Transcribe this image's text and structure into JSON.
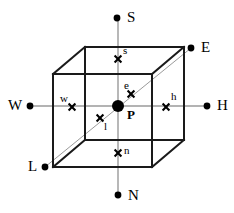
{
  "figure": {
    "type": "control-volume-cube-diagram",
    "width": 234,
    "height": 213,
    "colors": {
      "background": "#ffffff",
      "cube_stroke": "#1a1a1a",
      "axis_stroke": "#9a9a9a",
      "diagonal_stroke": "#9a9a9a",
      "marker": "#000000",
      "label": "#000000"
    },
    "stroke_widths": {
      "cube": 2.0,
      "axis": 1.3,
      "diagonal": 1.0
    }
  },
  "cube": {
    "front_face": [
      [
        53,
        74
      ],
      [
        152,
        74
      ],
      [
        152,
        167
      ],
      [
        53,
        167
      ]
    ],
    "back_face": [
      [
        85,
        47
      ],
      [
        184,
        47
      ],
      [
        184,
        140
      ],
      [
        85,
        140
      ]
    ],
    "connectors": [
      [
        [
          53,
          74
        ],
        [
          85,
          47
        ]
      ],
      [
        [
          152,
          74
        ],
        [
          184,
          47
        ]
      ],
      [
        [
          152,
          167
        ],
        [
          184,
          140
        ]
      ],
      [
        [
          53,
          167
        ],
        [
          85,
          140
        ]
      ]
    ]
  },
  "axes": [
    {
      "name": "vertical-axis-south-north",
      "x1": 118,
      "y1": 18,
      "x2": 118,
      "y2": 195
    },
    {
      "name": "horizontal-axis-west-high",
      "x1": 30,
      "y1": 106,
      "x2": 207,
      "y2": 106
    },
    {
      "name": "diagonal-axis-low-east",
      "x1": 45,
      "y1": 167,
      "x2": 191,
      "y2": 48
    }
  ],
  "center_node": {
    "label": "P",
    "x": 118,
    "y": 106,
    "radius": 6,
    "label_x": 128,
    "label_y": 108
  },
  "direction_nodes": [
    {
      "name": "node-south",
      "label": "S",
      "dot_x": 117,
      "dot_y": 18,
      "label_x": 127,
      "label_y": 11
    },
    {
      "name": "node-east",
      "label": "E",
      "dot_x": 191,
      "dot_y": 48,
      "label_x": 201,
      "label_y": 41
    },
    {
      "name": "node-high",
      "label": "H",
      "dot_x": 207,
      "dot_y": 106,
      "label_x": 217,
      "label_y": 99
    },
    {
      "name": "node-north",
      "label": "N",
      "dot_x": 118,
      "dot_y": 195,
      "label_x": 128,
      "label_y": 189
    },
    {
      "name": "node-low",
      "label": "L",
      "dot_x": 45,
      "dot_y": 167,
      "label_x": 28,
      "label_y": 160
    },
    {
      "name": "node-west",
      "label": "W",
      "dot_x": 30,
      "dot_y": 106,
      "label_x": 10,
      "label_y": 99
    }
  ],
  "face_markers": [
    {
      "name": "face-marker-s",
      "label": "s",
      "x": 118,
      "y": 59,
      "label_x": 123,
      "label_y": 47
    },
    {
      "name": "face-marker-e",
      "label": "e",
      "x": 131,
      "y": 94,
      "label_x": 124,
      "label_y": 82
    },
    {
      "name": "face-marker-h",
      "label": "h",
      "x": 166,
      "y": 107,
      "label_x": 171,
      "label_y": 93
    },
    {
      "name": "face-marker-n",
      "label": "n",
      "x": 118,
      "y": 153,
      "label_x": 123,
      "label_y": 147
    },
    {
      "name": "face-marker-l",
      "label": "l",
      "x": 100,
      "y": 118,
      "label_x": 104,
      "label_y": 122
    },
    {
      "name": "face-marker-w",
      "label": "w",
      "x": 72,
      "y": 107,
      "label_x": 61,
      "label_y": 95
    }
  ]
}
